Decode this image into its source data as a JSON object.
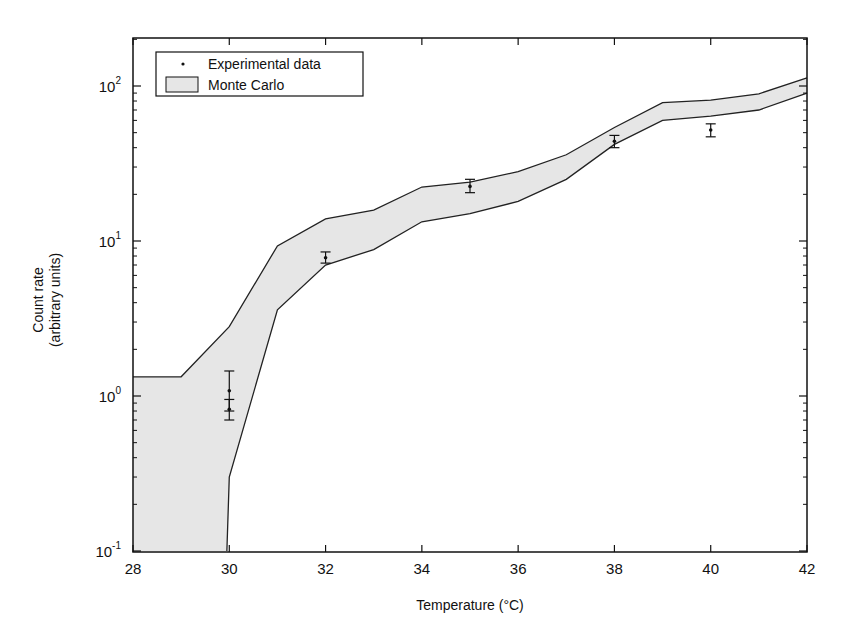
{
  "chart_data": {
    "type": "area",
    "title": "",
    "xlabel": "Temperature (°C)",
    "ylabel": "Count rate (arbitrary units)",
    "ylabel_lines": [
      "Count rate",
      "(arbitrary units)"
    ],
    "xlim": [
      28,
      42
    ],
    "ylim": [
      0.1,
      200
    ],
    "yscale": "log",
    "grid": false,
    "legend_position": "upper left",
    "x_ticks": [
      28,
      30,
      32,
      34,
      36,
      38,
      40,
      42
    ],
    "x_tick_labels": [
      "28",
      "30",
      "32",
      "34",
      "36",
      "38",
      "40",
      "42"
    ],
    "y_ticks": [
      0.1,
      1,
      10,
      100
    ],
    "y_tick_labels": [
      {
        "base": "10",
        "exp": "-1"
      },
      {
        "base": "10",
        "exp": "0"
      },
      {
        "base": "10",
        "exp": "1"
      },
      {
        "base": "10",
        "exp": "2"
      }
    ],
    "legend": [
      {
        "label": "Experimental data",
        "marker": "dot"
      },
      {
        "label": "Monte Carlo",
        "marker": "shaded-box"
      }
    ],
    "series": [
      {
        "name": "Monte Carlo",
        "kind": "band",
        "color": "#e6e6e6",
        "edge_color": "#222222",
        "x": [
          28,
          29,
          30,
          31,
          32,
          33,
          34,
          35,
          36,
          37,
          38,
          39,
          40,
          41,
          42
        ],
        "upper": [
          1.33,
          1.33,
          2.8,
          9.3,
          13.9,
          15.8,
          22.3,
          24,
          28,
          36,
          54,
          78,
          81,
          89,
          113
        ],
        "lower_x": [
          28,
          29,
          29.95,
          30.0,
          31,
          32,
          33,
          34,
          35,
          36,
          37,
          38,
          39,
          40,
          41,
          42
        ],
        "lower": [
          0.1,
          0.1,
          0.1,
          0.3,
          3.6,
          7.0,
          8.8,
          13.3,
          15,
          18,
          25,
          42,
          60,
          64,
          70,
          90
        ]
      },
      {
        "name": "Experimental data",
        "kind": "errorbar",
        "color": "#111111",
        "points": [
          {
            "x": 30,
            "y": 1.08,
            "ylo": 0.8,
            "yhi": 1.45
          },
          {
            "x": 30,
            "y": 0.82,
            "ylo": 0.7,
            "yhi": 0.95
          },
          {
            "x": 32,
            "y": 7.8,
            "ylo": 7.2,
            "yhi": 8.5
          },
          {
            "x": 35,
            "y": 22.5,
            "ylo": 20.5,
            "yhi": 25
          },
          {
            "x": 38,
            "y": 44,
            "ylo": 40,
            "yhi": 48
          },
          {
            "x": 40,
            "y": 52,
            "ylo": 47,
            "yhi": 57
          }
        ]
      }
    ]
  }
}
